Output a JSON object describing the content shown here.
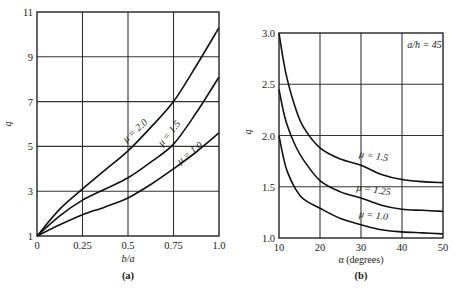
{
  "chart_data": [
    {
      "type": "line",
      "panel": "(a)",
      "title": "",
      "xlabel": "b/a",
      "ylabel": "q",
      "xlim": [
        0,
        1.0
      ],
      "ylim": [
        1,
        11
      ],
      "grid": true,
      "xticks": [
        0,
        0.25,
        0.5,
        0.75,
        1.0
      ],
      "xtick_labels": [
        "0",
        "0.25",
        "0.5",
        "0.75",
        "1.0"
      ],
      "yticks": [
        1,
        3,
        5,
        7,
        9,
        11
      ],
      "ytick_labels": [
        "1",
        "3",
        "5",
        "7",
        "9",
        "11"
      ],
      "x": [
        0,
        0.125,
        0.25,
        0.375,
        0.5,
        0.625,
        0.75,
        0.875,
        1.0
      ],
      "series": [
        {
          "name": "μ = 2.0",
          "values": [
            1.0,
            2.2,
            3.1,
            3.95,
            4.8,
            5.85,
            7.0,
            8.6,
            10.3
          ]
        },
        {
          "name": "μ = 1.5",
          "values": [
            1.0,
            1.9,
            2.6,
            3.1,
            3.6,
            4.3,
            5.1,
            6.5,
            8.1
          ]
        },
        {
          "name": "μ = 1.0",
          "values": [
            1.0,
            1.5,
            1.95,
            2.3,
            2.7,
            3.3,
            4.0,
            4.75,
            5.6
          ]
        }
      ],
      "annotations": [
        {
          "text": "μ = 2.0",
          "x": 0.55,
          "y": 5.6
        },
        {
          "text": "μ = 1.5",
          "x": 0.74,
          "y": 5.5
        },
        {
          "text": "μ = 1.0",
          "x": 0.85,
          "y": 4.6
        }
      ],
      "legend": "none (inline curve labels)"
    },
    {
      "type": "line",
      "panel": "(b)",
      "title": "",
      "xlabel": "α (degrees)",
      "ylabel": "q",
      "xlim": [
        10,
        50
      ],
      "ylim": [
        1.0,
        3.0
      ],
      "grid": true,
      "xticks": [
        10,
        20,
        30,
        40,
        50
      ],
      "xtick_labels": [
        "10",
        "20",
        "30",
        "40",
        "50"
      ],
      "yticks": [
        1.0,
        1.5,
        2.0,
        2.5,
        3.0
      ],
      "ytick_labels": [
        "1.0",
        "1.5",
        "2.0",
        "2.5",
        "3.0"
      ],
      "x": [
        10,
        11,
        12,
        14,
        16,
        20,
        25,
        30,
        35,
        40,
        45,
        50
      ],
      "series": [
        {
          "name": "μ = 1.5",
          "values": [
            3.0,
            2.75,
            2.55,
            2.27,
            2.08,
            1.88,
            1.77,
            1.71,
            1.62,
            1.57,
            1.55,
            1.54
          ]
        },
        {
          "name": "μ = 1.25",
          "values": [
            2.45,
            2.25,
            2.1,
            1.9,
            1.76,
            1.56,
            1.45,
            1.39,
            1.32,
            1.28,
            1.27,
            1.26
          ]
        },
        {
          "name": "μ = 1.0",
          "values": [
            2.0,
            1.8,
            1.65,
            1.48,
            1.38,
            1.29,
            1.19,
            1.13,
            1.08,
            1.06,
            1.05,
            1.04
          ]
        }
      ],
      "annotations": [
        {
          "text": "a/h = 45",
          "x": 45.5,
          "y": 2.85
        },
        {
          "text": "μ = 1.5",
          "x": 33,
          "y": 1.77
        },
        {
          "text": "μ = 1.25",
          "x": 33,
          "y": 1.44
        },
        {
          "text": "μ = 1.0",
          "x": 33,
          "y": 1.19
        }
      ],
      "legend": "none (inline curve labels)"
    }
  ],
  "panels": {
    "a": {
      "caption": "(a)",
      "xlabel": "b/a",
      "ylabel": "q"
    },
    "b": {
      "caption": "(b)",
      "xlabel": "α (degrees)",
      "ylabel": "q",
      "annotation": "a/h = 45"
    }
  }
}
